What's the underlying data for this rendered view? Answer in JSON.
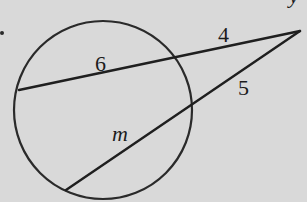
{
  "diagram": {
    "type": "circle-secant-secant",
    "background_color": "#d9d9d9",
    "stroke_color": "#2a2a2a",
    "circle": {
      "cx": 103,
      "cy": 110,
      "r": 89
    },
    "external_point": {
      "x": 300,
      "y": 31
    },
    "secants": [
      {
        "name": "upper-secant",
        "external_segment_label": "4",
        "internal_chord_label": "6",
        "near_intersection": {
          "x": 172,
          "y": 58
        },
        "far_intersection": {
          "x": 19,
          "y": 90
        }
      },
      {
        "name": "lower-secant",
        "external_segment_label": "5",
        "internal_chord_label": "m",
        "near_intersection": {
          "x": 190,
          "y": 107
        },
        "far_intersection": {
          "x": 66,
          "y": 190
        }
      }
    ],
    "labels": {
      "upper_chord": "6",
      "upper_external": "4",
      "lower_external": "5",
      "lower_chord": "m"
    },
    "stray_marks": {
      "left_dot": ".",
      "top_right_fragment": "y"
    }
  }
}
